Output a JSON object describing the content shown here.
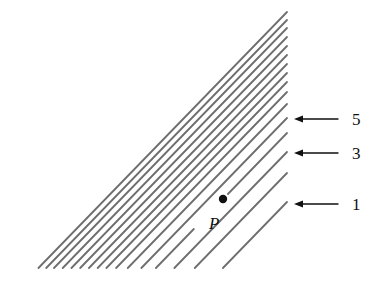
{
  "diagram": {
    "line_color": "#6e6e6e",
    "right_edge_x": 287,
    "bottom_y": 268,
    "slope": 1.03,
    "contour_right_ends_y": [
      12,
      20,
      28,
      37,
      46,
      55,
      64,
      73,
      82,
      92,
      104,
      118,
      133,
      152,
      173,
      202
    ],
    "point": {
      "label": "P",
      "x": 223,
      "y": 199,
      "on_contour_index": 12
    },
    "level_labels": [
      {
        "label": "5",
        "y": 119,
        "arrow_from_x": 338,
        "arrow_to_x": 294
      },
      {
        "label": "3",
        "y": 153,
        "arrow_from_x": 338,
        "arrow_to_x": 294
      },
      {
        "label": "1",
        "y": 204,
        "arrow_from_x": 338,
        "arrow_to_x": 294
      }
    ]
  }
}
